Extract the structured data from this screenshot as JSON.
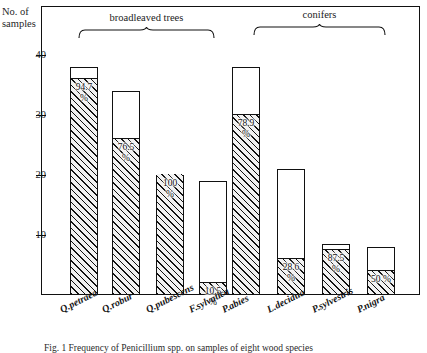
{
  "figure": {
    "y_axis_title_line1": "No. of",
    "y_axis_title_line2": "samples",
    "caption": "Fig. 1 Frequency of Penicillium spp. on samples of eight wood species"
  },
  "groups": [
    {
      "id": "broadleaved",
      "label": "broadleaved trees"
    },
    {
      "id": "conifers",
      "label": "conifers"
    }
  ],
  "chart_data": {
    "type": "bar",
    "title": "",
    "xlabel": "",
    "ylabel": "No. of samples",
    "ylim": [
      0,
      42
    ],
    "yticks": [
      10,
      20,
      30,
      40
    ],
    "ytick_labels": [
      "10",
      "20",
      "30",
      "40"
    ],
    "grid": false,
    "legend": false,
    "stacked": true,
    "categories": [
      "Q.petraea",
      "Q.robur",
      "Q.pubescens",
      "F.sylvatica",
      "P.abies",
      "L.decidua",
      "P.sylvestris",
      "P.nigra"
    ],
    "groups": [
      "broadleaved trees",
      "broadleaved trees",
      "broadleaved trees",
      "broadleaved trees",
      "conifers",
      "conifers",
      "conifers",
      "conifers"
    ],
    "series": [
      {
        "name": "infested (hatched)",
        "values": [
          36,
          26,
          20,
          2,
          30,
          6,
          7.5,
          4
        ]
      },
      {
        "name": "total samples",
        "values": [
          38,
          34,
          20,
          19,
          38,
          21,
          8.5,
          8
        ]
      }
    ],
    "data_labels": [
      "94.7\n%",
      "76.5\n%",
      "100\n%",
      "10.5\n%",
      "78.9\n%",
      "28.6\n%",
      "87.5\n%",
      "50 %"
    ],
    "percentages": [
      94.7,
      76.5,
      100,
      10.5,
      78.9,
      28.6,
      87.5,
      50
    ],
    "percent_labels_line1": [
      "94.7",
      "76.5",
      "100",
      "10.5",
      "78.9",
      "28.6",
      "87.5",
      "50 %"
    ],
    "percent_labels_line2": [
      "%",
      "%",
      "%",
      "%",
      "%",
      "%",
      "%",
      ""
    ]
  }
}
